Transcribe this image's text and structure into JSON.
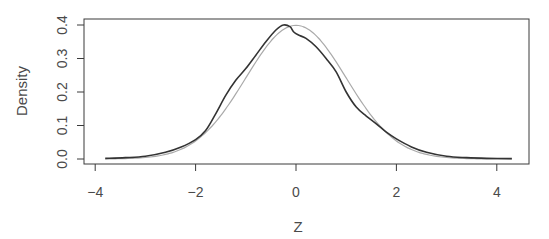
{
  "chart_data": {
    "type": "line",
    "title": "",
    "xlabel": "Z",
    "ylabel": "Density",
    "xlim": [
      -4.2,
      4.65
    ],
    "ylim": [
      -0.015,
      0.418
    ],
    "x_ticks": [
      -4,
      -2,
      0,
      2,
      4
    ],
    "x_tick_labels": [
      "-4",
      "-2",
      "0",
      "2",
      "4"
    ],
    "y_ticks": [
      0.0,
      0.1,
      0.2,
      0.3,
      0.4
    ],
    "y_tick_labels": [
      "0.0",
      "0.1",
      "0.2",
      "0.3",
      "0.4"
    ],
    "grid": false,
    "legend": null,
    "series": [
      {
        "name": "Empirical density of Z",
        "color": "#333333",
        "width": 1.6,
        "x": [
          -3.8,
          -3.4,
          -3.0,
          -2.6,
          -2.3,
          -2.0,
          -1.8,
          -1.6,
          -1.4,
          -1.2,
          -1.0,
          -0.8,
          -0.6,
          -0.4,
          -0.25,
          -0.12,
          -0.05,
          0.05,
          0.2,
          0.4,
          0.6,
          0.8,
          1.0,
          1.2,
          1.4,
          1.6,
          1.8,
          2.0,
          2.3,
          2.6,
          3.0,
          3.4,
          3.8,
          4.3
        ],
        "y": [
          0.002,
          0.004,
          0.008,
          0.02,
          0.035,
          0.058,
          0.085,
          0.135,
          0.19,
          0.235,
          0.27,
          0.31,
          0.35,
          0.385,
          0.4,
          0.395,
          0.38,
          0.37,
          0.36,
          0.335,
          0.3,
          0.26,
          0.2,
          0.155,
          0.128,
          0.105,
          0.08,
          0.06,
          0.036,
          0.02,
          0.008,
          0.004,
          0.002,
          0.001
        ]
      },
      {
        "name": "Standard normal density",
        "color": "#aaaaaa",
        "width": 1.2,
        "function": "dnorm",
        "x_range": [
          -3.8,
          4.3
        ]
      }
    ]
  }
}
